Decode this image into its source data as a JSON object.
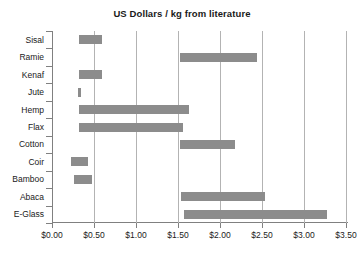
{
  "chart_data": {
    "type": "bar",
    "orientation": "horizontal",
    "subtype": "floating-range-bar",
    "title": "US Dollars / kg from literature",
    "xlabel": "",
    "ylabel": "",
    "xlim": [
      0.0,
      3.5
    ],
    "grid": true,
    "legend": "none",
    "xtick_labels": [
      "$0.00",
      "$0.50",
      "$1.00",
      "$1.50",
      "$2.00",
      "$2.50",
      "$3.00",
      "$3.50"
    ],
    "xtick_values": [
      0.0,
      0.5,
      1.0,
      1.5,
      2.0,
      2.5,
      3.0,
      3.5
    ],
    "categories": [
      "Sisal",
      "Ramie",
      "Kenaf",
      "Jute",
      "Hemp",
      "Flax",
      "Cotton",
      "Coir",
      "Bamboo",
      "Abaca",
      "E-Glass"
    ],
    "ranges": [
      {
        "category": "Sisal",
        "low": 0.32,
        "high": 0.6
      },
      {
        "category": "Ramie",
        "low": 1.52,
        "high": 2.44
      },
      {
        "category": "Kenaf",
        "low": 0.32,
        "high": 0.6
      },
      {
        "category": "Jute",
        "low": 0.31,
        "high": 0.34
      },
      {
        "category": "Hemp",
        "low": 0.32,
        "high": 1.63
      },
      {
        "category": "Flax",
        "low": 0.32,
        "high": 1.56
      },
      {
        "category": "Cotton",
        "low": 1.52,
        "high": 2.18
      },
      {
        "category": "Coir",
        "low": 0.23,
        "high": 0.43
      },
      {
        "category": "Bamboo",
        "low": 0.26,
        "high": 0.48
      },
      {
        "category": "Abaca",
        "low": 1.54,
        "high": 2.54
      },
      {
        "category": "E-Glass",
        "low": 1.57,
        "high": 3.27
      }
    ],
    "colors": {
      "bar": "#8c8c8c",
      "gridline": "#b3b3b3",
      "axis": "#808080",
      "text": "#1a1a1a",
      "background": "#ffffff"
    }
  }
}
